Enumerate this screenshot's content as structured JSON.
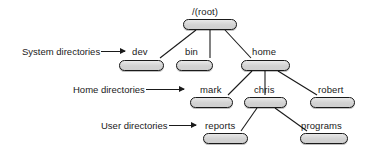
{
  "diagram": {
    "title_visible": false,
    "background_color": "#ffffff",
    "node_fill": "#dcdcdc",
    "node_border": "#1a1a1a",
    "edge_color": "#1a1a1a",
    "text_color": "#1a1a1a"
  },
  "nodes": [
    {
      "id": "root",
      "label": "/(root)",
      "x": 183,
      "y": 19,
      "w": 54,
      "h": 11,
      "label_x": 192,
      "label_y": 7
    },
    {
      "id": "dev",
      "label": "dev",
      "x": 119,
      "y": 60,
      "w": 45,
      "h": 11,
      "label_x": 132,
      "label_y": 47
    },
    {
      "id": "bin",
      "label": "bin",
      "x": 176,
      "y": 60,
      "w": 37,
      "h": 11,
      "label_x": 185,
      "label_y": 47
    },
    {
      "id": "home",
      "label": "home",
      "x": 241,
      "y": 60,
      "w": 49,
      "h": 11,
      "label_x": 252,
      "label_y": 47
    },
    {
      "id": "mark",
      "label": "mark",
      "x": 190,
      "y": 97,
      "w": 43,
      "h": 11,
      "label_x": 200,
      "label_y": 85
    },
    {
      "id": "chris",
      "label": "chris",
      "x": 244,
      "y": 97,
      "w": 43,
      "h": 11,
      "label_x": 254,
      "label_y": 85
    },
    {
      "id": "robert",
      "label": "robert",
      "x": 310,
      "y": 97,
      "w": 45,
      "h": 11,
      "label_x": 318,
      "label_y": 85
    },
    {
      "id": "reports",
      "label": "reports",
      "x": 203,
      "y": 133,
      "w": 45,
      "h": 11,
      "label_x": 205,
      "label_y": 121
    },
    {
      "id": "programs",
      "label": "programs",
      "x": 300,
      "y": 133,
      "w": 48,
      "h": 11,
      "label_x": 301,
      "label_y": 121
    }
  ],
  "edges": [
    {
      "from": "root",
      "to": "dev",
      "x1": 196,
      "y1": 30,
      "x2": 160,
      "y2": 58
    },
    {
      "from": "root",
      "to": "bin",
      "x1": 210,
      "y1": 30,
      "x2": 210,
      "y2": 58
    },
    {
      "from": "root",
      "to": "home",
      "x1": 225,
      "y1": 30,
      "x2": 251,
      "y2": 58
    },
    {
      "from": "home",
      "to": "mark",
      "x1": 252,
      "y1": 71,
      "x2": 228,
      "y2": 95
    },
    {
      "from": "home",
      "to": "chris",
      "x1": 265,
      "y1": 71,
      "x2": 265,
      "y2": 95
    },
    {
      "from": "home",
      "to": "robert",
      "x1": 278,
      "y1": 71,
      "x2": 317,
      "y2": 95
    },
    {
      "from": "chris",
      "to": "reports",
      "x1": 257,
      "y1": 108,
      "x2": 241,
      "y2": 131
    },
    {
      "from": "chris",
      "to": "programs",
      "x1": 275,
      "y1": 108,
      "x2": 307,
      "y2": 131
    }
  ],
  "annotations": [
    {
      "id": "system-directories",
      "text": "System directories",
      "x": 22,
      "y": 46,
      "arrow_len": 24
    },
    {
      "id": "home-directories",
      "text": "Home directories",
      "x": 73,
      "y": 84,
      "arrow_len": 38
    },
    {
      "id": "user-directories",
      "text": "User directories",
      "x": 101,
      "y": 120,
      "arrow_len": 27
    }
  ]
}
